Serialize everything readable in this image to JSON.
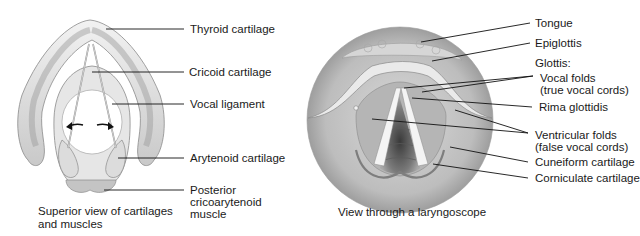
{
  "left_panel": {
    "caption_line1": "Superior view of cartilages",
    "caption_line2": "and muscles",
    "labels": {
      "thyroid": "Thyroid cartilage",
      "cricoid": "Cricoid cartilage",
      "vocal_ligament": "Vocal ligament",
      "arytenoid": "Arytenoid cartilage",
      "posterior_line1": "Posterior",
      "posterior_line2": "cricoarytenoid",
      "posterior_line3": "muscle"
    }
  },
  "right_panel": {
    "caption": "View through a laryngoscope",
    "labels": {
      "tongue": "Tongue",
      "epiglottis": "Epiglottis",
      "glottis": "Glottis:",
      "vocal_folds_line1": "Vocal folds",
      "vocal_folds_line2": "(true vocal cords)",
      "rima": "Rima glottidis",
      "ventricular_line1": "Ventricular folds",
      "ventricular_line2": "(false vocal cords)",
      "cuneiform": "Cuneiform cartilage",
      "corniculate": "Corniculate cartilage"
    }
  }
}
